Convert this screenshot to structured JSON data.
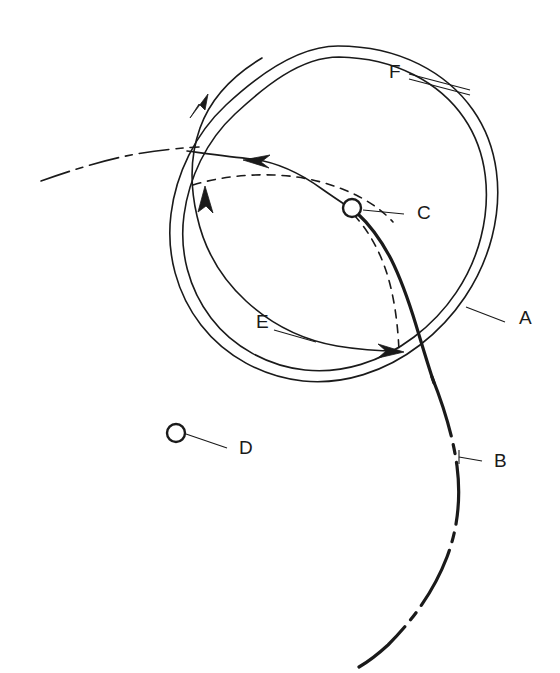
{
  "figure": {
    "background_color": "#ffffff",
    "ink_color": "#1a1a1a",
    "width": 560,
    "height": 673
  },
  "labels": [
    {
      "id": "A",
      "text": "A",
      "x": 519,
      "y": 319,
      "refers_to": "outer-circular-orbit-line",
      "leader": {
        "x1": 505,
        "y1": 322,
        "x2": 466,
        "y2": 307
      }
    },
    {
      "id": "B",
      "text": "B",
      "x": 494,
      "y": 462,
      "refers_to": "dash-dot-trajectory-lower-right",
      "leader": {
        "x1": 482,
        "y1": 461,
        "x2": 459,
        "y2": 457
      }
    },
    {
      "id": "C",
      "text": "C",
      "x": 417,
      "y": 214,
      "refers_to": "node-marker-on-solid-transfer-curve",
      "leader": {
        "x1": 404,
        "y1": 214,
        "x2": 363,
        "y2": 210
      }
    },
    {
      "id": "D",
      "text": "D",
      "x": 239,
      "y": 449,
      "refers_to": "isolated-node-marker",
      "leader": {
        "x1": 227,
        "y1": 448,
        "x2": 186,
        "y2": 434
      }
    },
    {
      "id": "E",
      "text": "E",
      "x": 263,
      "y": 323,
      "refers_to": "inner-spiral-arc",
      "leader": {
        "x1": 274,
        "y1": 330,
        "x2": 312,
        "y2": 341
      }
    },
    {
      "id": "F",
      "text": "F",
      "x": 396,
      "y": 73,
      "refers_to": "annular-gap-between-spiral-and-orbit",
      "leader": {
        "x1": 409,
        "y1": 76,
        "x2": 468,
        "y2": 92
      }
    }
  ],
  "geometry": {
    "circle_center": {
      "x": 338,
      "y": 205
    },
    "outer_circle_radius": 159,
    "inner_circle_radius": 148,
    "spiral_radius": 136,
    "node_C": {
      "x": 352,
      "y": 208,
      "radius": 9
    },
    "node_D": {
      "x": 176,
      "y": 433,
      "radius": 9
    }
  },
  "arrows": [
    {
      "name": "spiral-exit-arrow-upper-left",
      "direction": "down-left",
      "x": 196,
      "y": 107
    },
    {
      "name": "transfer-curve-arrow-inbound",
      "direction": "left",
      "x": 250,
      "y": 159
    },
    {
      "name": "spiral-arrow-left-up",
      "direction": "up",
      "x": 206,
      "y": 190
    },
    {
      "name": "spiral-arrow-bottom-right",
      "direction": "right",
      "x": 397,
      "y": 352
    }
  ],
  "line_styles": {
    "solid": "continuous",
    "dashed": "8 7",
    "dash_dot": "30 7 7 7"
  }
}
